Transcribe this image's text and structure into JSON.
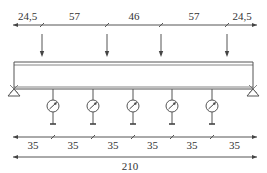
{
  "diagram": {
    "type": "beam-loading-test-setup",
    "colors": {
      "line": "#555555",
      "text": "#333333",
      "background": "#ffffff"
    },
    "top_dimensions": {
      "segments": [
        {
          "label": "24,5",
          "x1": 13,
          "x2": 42
        },
        {
          "label": "57",
          "x1": 42,
          "x2": 107
        },
        {
          "label": "46",
          "x1": 107,
          "x2": 161
        },
        {
          "label": "57",
          "x1": 161,
          "x2": 227
        },
        {
          "label": "24,5",
          "x1": 227,
          "x2": 257
        }
      ]
    },
    "point_loads": {
      "count": 4,
      "x_positions": [
        42,
        107,
        161,
        227
      ],
      "icon": "down-arrow-icon"
    },
    "beam": {
      "x1": 14,
      "x2": 253,
      "top_y": 62,
      "flange_y": 65,
      "bottom_y": 89
    },
    "supports": [
      {
        "side": "left",
        "x": 14,
        "icon": "pin-support-icon"
      },
      {
        "side": "right",
        "x": 253,
        "icon": "pin-support-icon"
      }
    ],
    "dial_gauges": {
      "count": 5,
      "x_positions": [
        53,
        93,
        133,
        172,
        212
      ],
      "icon": "dial-gauge-icon"
    },
    "bottom_dimensions": {
      "segments": [
        {
          "label": "35",
          "x1": 13,
          "x2": 53
        },
        {
          "label": "35",
          "x1": 53,
          "x2": 93
        },
        {
          "label": "35",
          "x1": 93,
          "x2": 133
        },
        {
          "label": "35",
          "x1": 133,
          "x2": 172
        },
        {
          "label": "35",
          "x1": 172,
          "x2": 212
        },
        {
          "label": "35",
          "x1": 212,
          "x2": 257
        }
      ]
    },
    "total_dimension": {
      "label": "210",
      "x1": 13,
      "x2": 257
    }
  }
}
